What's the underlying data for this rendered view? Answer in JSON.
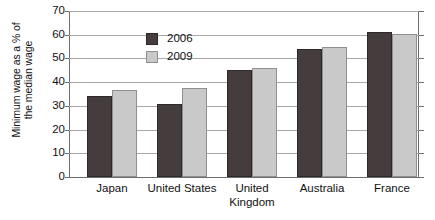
{
  "chart_data": {
    "type": "bar",
    "title": "",
    "xlabel": "",
    "ylabel": "Minimum wage as a % of the median wage",
    "ylabel_lines": [
      "Minimum wage as a % of",
      "the median wage"
    ],
    "categories": [
      "Japan",
      "United States",
      "United Kingdom",
      "Australia",
      "France"
    ],
    "category_lines": [
      [
        "Japan"
      ],
      [
        "United States"
      ],
      [
        "United",
        "Kingdom"
      ],
      [
        "Australia"
      ],
      [
        "France"
      ]
    ],
    "series": [
      {
        "name": "2006",
        "color": "#453d3d",
        "values": [
          34,
          31,
          45,
          54,
          61
        ]
      },
      {
        "name": "2009",
        "color": "#c9c9c9",
        "values": [
          36.5,
          37.5,
          46,
          55,
          60.5
        ]
      }
    ],
    "ylim": [
      0,
      70
    ],
    "yticks": [
      0,
      10,
      20,
      30,
      40,
      50,
      60,
      70
    ],
    "ytick_labels": [
      "0",
      "10",
      "20",
      "30",
      "40",
      "50",
      "60",
      "70"
    ],
    "grid": true,
    "grid_axis": "y",
    "legend_position": "top-left",
    "legend": [
      "2006",
      "2009"
    ]
  }
}
